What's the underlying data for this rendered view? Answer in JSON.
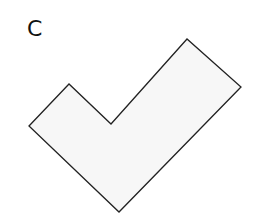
{
  "figure": {
    "label": "C",
    "shape": {
      "name": "checkmark-polygon",
      "points": [
        [
          29,
          126
        ],
        [
          69,
          84
        ],
        [
          111,
          124
        ],
        [
          187,
          39
        ],
        [
          241,
          87
        ],
        [
          119,
          212
        ]
      ],
      "fill": "#f7f7f7",
      "stroke": "#222222",
      "stroke_width": 1.3
    }
  }
}
